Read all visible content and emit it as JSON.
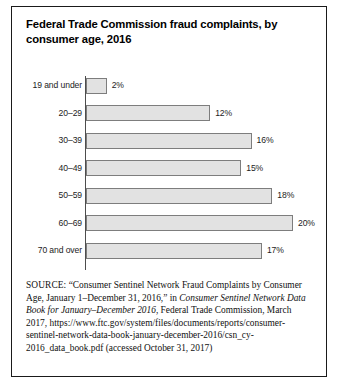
{
  "chart_data": {
    "type": "bar",
    "orientation": "horizontal",
    "title": "Federal Trade Commission fraud complaints, by consumer age, 2016",
    "xlabel": "",
    "ylabel": "",
    "grid": false,
    "legend": null,
    "xlim": [
      0,
      20
    ],
    "value_suffix": "%",
    "categories": [
      "19 and under",
      "20–29",
      "30–39",
      "40–49",
      "50–59",
      "60–69",
      "70 and over"
    ],
    "values": [
      2,
      12,
      16,
      15,
      18,
      20,
      17
    ],
    "value_labels": [
      "2%",
      "12%",
      "16%",
      "15%",
      "18%",
      "20%",
      "17%"
    ]
  },
  "source": {
    "label": "SOURCE:",
    "line1": "“Consumer Sentinel Network Fraud Complaints by Consumer Age, January 1–December 31, 2016,” in ",
    "italic1": "Consumer Sentinel Network Data Book for January–December 2016",
    "line2": ", Federal Trade Commission, March 2017, https://www.ftc.gov/system/files/documents/reports/consumer-sentinel-network-data-book-january-december-2016/csn_cy-2016_data_book.pdf (accessed October 31, 2017)"
  },
  "colors": {
    "bar_fill": "#e2e2e2",
    "bar_stroke": "#7d7d7d",
    "axis": "#4d4d4d",
    "frame": "#1a1a1a",
    "text": "#111111"
  }
}
